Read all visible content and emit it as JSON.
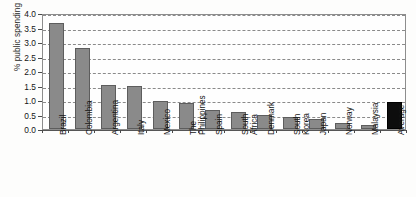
{
  "chart_data": {
    "type": "bar",
    "title": "",
    "subtitle": "",
    "xlabel": "",
    "ylabel": "% public spending",
    "ylim": [
      0,
      4.0
    ],
    "ytick_step": 0.5,
    "ytick_labels": [
      "0.0",
      "0.5",
      "1.0",
      "1.5",
      "2.0",
      "2.5",
      "3.0",
      "3.5",
      "4.0"
    ],
    "grid": true,
    "grid_style": "dashed-horizontal",
    "legend": "none",
    "categories": [
      "Brazil",
      "Colombia",
      "Argentina",
      "Italy",
      "Mexico",
      "The\nPhilippines",
      "Spain",
      "South\nAfrica",
      "Denmark",
      "South\nKorea",
      "Japan",
      "Norway",
      "Malaysia",
      "Average"
    ],
    "values": [
      3.65,
      2.8,
      1.53,
      1.5,
      0.98,
      0.9,
      0.65,
      0.6,
      0.48,
      0.41,
      0.36,
      0.21,
      0.13,
      0.93
    ],
    "bar_colors": [
      "#8a8a8a",
      "#8a8a8a",
      "#8a8a8a",
      "#8a8a8a",
      "#8a8a8a",
      "#8a8a8a",
      "#8a8a8a",
      "#8a8a8a",
      "#8a8a8a",
      "#8a8a8a",
      "#8a8a8a",
      "#8a8a8a",
      "#8a8a8a",
      "#0d0d0d"
    ],
    "highlight_index": 13,
    "accent_color": "#8a8a8a",
    "highlight_color": "#0d0d0d",
    "axis_color": "#555555",
    "grid_color": "#8a8a8a"
  }
}
